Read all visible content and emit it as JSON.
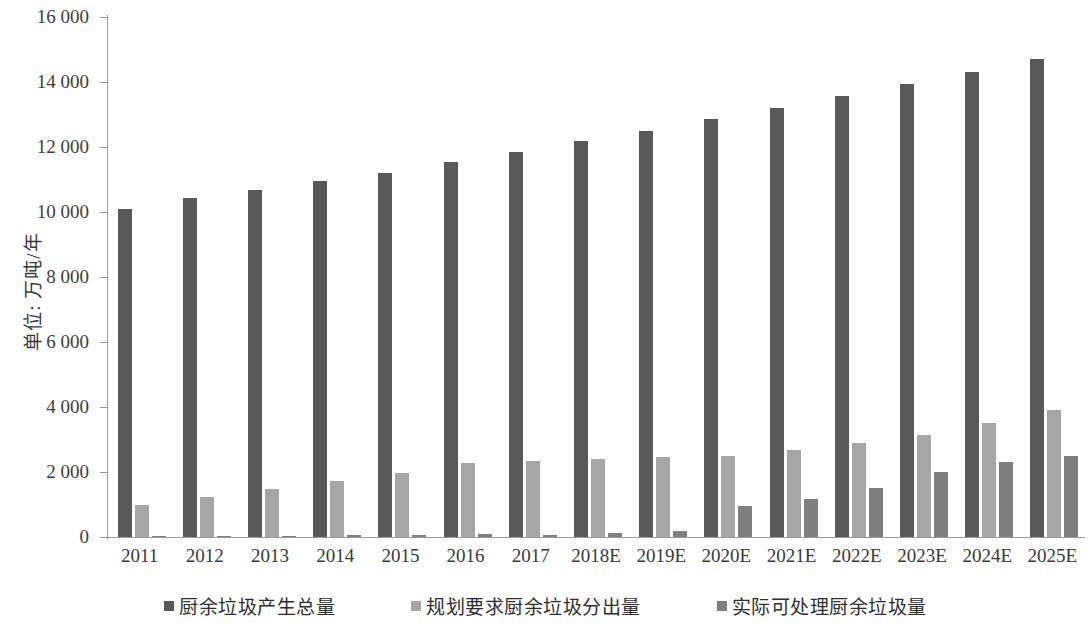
{
  "chart_data": {
    "type": "bar",
    "title": "",
    "subtitle": "",
    "xlabel": "",
    "ylabel": "单位: 万吨/年",
    "ylim": [
      0,
      16000
    ],
    "ytick_step": 2000,
    "ytick_labels": [
      "0",
      "2 000",
      "4 000",
      "6 000",
      "8 000",
      "10 000",
      "12 000",
      "14 000",
      "16 000"
    ],
    "ytick_values": [
      0,
      2000,
      4000,
      6000,
      8000,
      10000,
      12000,
      14000,
      16000
    ],
    "grid": false,
    "legend_position": "bottom",
    "categories": [
      "2011",
      "2012",
      "2013",
      "2014",
      "2015",
      "2016",
      "2017",
      "2018E",
      "2019E",
      "2020E",
      "2021E",
      "2022E",
      "2023E",
      "2024E",
      "2025E"
    ],
    "series": [
      {
        "name": "厨余垃圾产生总量",
        "color": "#595959",
        "values": [
          10100,
          10430,
          10670,
          10950,
          11200,
          11530,
          11850,
          12200,
          12480,
          12850,
          13200,
          13560,
          13950,
          14310,
          14700
        ]
      },
      {
        "name": "规划要求厨余垃圾分出量",
        "color": "#a6a6a6",
        "values": [
          1000,
          1240,
          1470,
          1730,
          1980,
          2270,
          2340,
          2400,
          2450,
          2500,
          2690,
          2890,
          3150,
          3510,
          3920
        ]
      },
      {
        "name": "实际可处理厨余垃圾量",
        "color": "#7f7f7f",
        "values": [
          20,
          30,
          40,
          50,
          60,
          80,
          70,
          110,
          200,
          950,
          1160,
          1520,
          1990,
          2310,
          2500
        ]
      }
    ]
  },
  "legend": {
    "items": [
      {
        "label": "厨余垃圾产生总量",
        "color": "#595959"
      },
      {
        "label": "规划要求厨余垃圾分出量",
        "color": "#a6a6a6"
      },
      {
        "label": "实际可处理厨余垃圾量",
        "color": "#7f7f7f"
      }
    ]
  },
  "axes": {
    "y_title": "单位: 万吨/年"
  }
}
